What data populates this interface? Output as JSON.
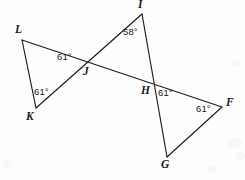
{
  "figure": {
    "kind": "geometry-diagram",
    "width": 245,
    "height": 180,
    "background_color": "#fdfdfd",
    "stroke_color": "#1c1c1c",
    "stroke_width": 1.15,
    "label_color": "#1a1a1a"
  },
  "points": [
    {
      "id": "L",
      "label": "L",
      "x": 22,
      "y": 40,
      "label_x": 15,
      "label_y": 24
    },
    {
      "id": "K",
      "label": "K",
      "x": 36,
      "y": 108,
      "label_x": 26,
      "label_y": 111
    },
    {
      "id": "J",
      "label": "J",
      "x": 85,
      "y": 63,
      "label_x": 83,
      "label_y": 66
    },
    {
      "id": "I",
      "label": "I",
      "x": 142,
      "y": 14,
      "label_x": 138,
      "label_y": -1
    },
    {
      "id": "H",
      "label": "H",
      "x": 152,
      "y": 83,
      "label_x": 141,
      "label_y": 85
    },
    {
      "id": "F",
      "label": "F",
      "x": 222,
      "y": 107,
      "label_x": 226,
      "label_y": 97
    },
    {
      "id": "G",
      "label": "G",
      "x": 167,
      "y": 157,
      "label_x": 161,
      "label_y": 159
    }
  ],
  "segments": [
    {
      "id": "L-F",
      "from": "L",
      "to": "F",
      "note": "long transversal through J and H"
    },
    {
      "id": "K-I",
      "from": "K",
      "to": "I",
      "note": "line through J"
    },
    {
      "id": "I-G",
      "from": "I",
      "to": "G",
      "note": "line through H"
    },
    {
      "id": "L-K",
      "from": "L",
      "to": "K",
      "note": "side of triangle LJK"
    },
    {
      "id": "F-G",
      "from": "F",
      "to": "G",
      "note": "side of triangle HFG"
    }
  ],
  "angles": [
    {
      "id": "angle-J",
      "vertex": "J",
      "value": "61°",
      "x": 57,
      "y": 52
    },
    {
      "id": "angle-K",
      "vertex": "K",
      "value": "61°",
      "x": 34,
      "y": 87
    },
    {
      "id": "angle-I",
      "vertex": "I",
      "value": "58°",
      "x": 123,
      "y": 27
    },
    {
      "id": "angle-H",
      "vertex": "H",
      "value": "61°",
      "x": 158,
      "y": 88
    },
    {
      "id": "angle-F",
      "vertex": "F",
      "value": "61°",
      "x": 196,
      "y": 104
    }
  ],
  "scan_artifacts": [
    {
      "x": 228,
      "y": 138,
      "w": 14,
      "h": 10
    },
    {
      "x": 236,
      "y": 152,
      "w": 9,
      "h": 8
    },
    {
      "x": 206,
      "y": 166,
      "w": 11,
      "h": 7
    },
    {
      "x": 2,
      "y": 160,
      "w": 10,
      "h": 8
    },
    {
      "x": 232,
      "y": 60,
      "w": 8,
      "h": 7
    }
  ]
}
